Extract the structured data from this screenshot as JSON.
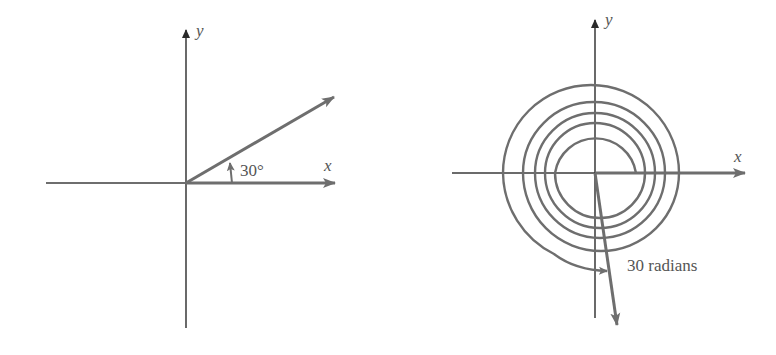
{
  "colors": {
    "axis": "#3a3a3a",
    "vector": "#6e6e6e",
    "text": "#555555",
    "background": "#ffffff"
  },
  "left_diagram": {
    "x_axis_label": "x",
    "y_axis_label": "y",
    "angle_label": "30°",
    "angle_degrees": 30
  },
  "right_diagram": {
    "x_axis_label": "x",
    "y_axis_label": "y",
    "angle_label": "30 radians",
    "angle_radians": 30,
    "spiral_turns_visible": 5
  }
}
